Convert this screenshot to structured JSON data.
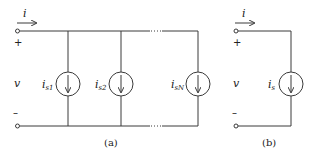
{
  "diagram": {
    "type": "circuit",
    "circuit_a": {
      "caption": "(a)",
      "current_label": "i",
      "voltage_label": "v",
      "plus_sign": "+",
      "minus_sign": "–",
      "continuation": "⋯",
      "sources": [
        {
          "base": "i",
          "subscript": "s1"
        },
        {
          "base": "i",
          "subscript": "s2"
        },
        {
          "base": "i",
          "subscript": "sN"
        }
      ]
    },
    "circuit_b": {
      "caption": "(b)",
      "current_label": "i",
      "voltage_label": "v",
      "plus_sign": "+",
      "minus_sign": "–",
      "source": {
        "base": "i",
        "subscript": "s"
      }
    }
  }
}
